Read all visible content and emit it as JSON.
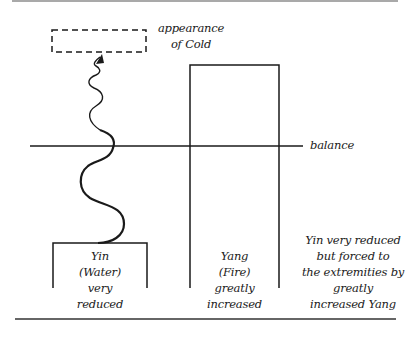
{
  "diagram": {
    "labels": {
      "appearance": [
        "appearance",
        "of Cold"
      ],
      "balance": "balance",
      "yin": [
        "Yin",
        "(Water)",
        "very",
        "reduced"
      ],
      "yang": [
        "Yang",
        "(Fire)",
        "greatly",
        "increased"
      ],
      "caption": [
        "Yin very reduced",
        "but forced to",
        "the extremities by",
        "greatly",
        "increased Yang"
      ]
    },
    "elements": {
      "dashed_box": "appearance of Cold (illusory)",
      "wave": "Yin forced upward",
      "balance_line": "balance level",
      "yin_bar": "Yin level, below balance",
      "yang_bar": "Yang level, above balance"
    },
    "colors": {
      "stroke": "#1a1a1a",
      "background": "#ffffff"
    }
  }
}
